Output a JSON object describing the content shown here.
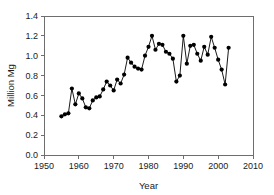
{
  "chart_data": {
    "type": "line",
    "title": "",
    "xlabel": "Year",
    "ylabel": "Million Mg",
    "xlim": [
      1950,
      2010
    ],
    "ylim": [
      0.0,
      1.4
    ],
    "xticks": [
      1950,
      1960,
      1970,
      1980,
      1990,
      2000,
      2010
    ],
    "xtick_labels": [
      "1950",
      "1960",
      "1970",
      "1980",
      "1990",
      "2000",
      "2010"
    ],
    "yticks": [
      0.0,
      0.2,
      0.4,
      0.6,
      0.8,
      1.0,
      1.2,
      1.4
    ],
    "ytick_labels": [
      "0.0",
      "0.2",
      "0.4",
      "0.6",
      "0.8",
      "1.0",
      "1.2",
      "1.4"
    ],
    "grid": false,
    "legend": false,
    "legend_position": "none",
    "marker": "filled-circle",
    "line_color": "#000000",
    "marker_color": "#000000",
    "x": [
      1955,
      1956,
      1957,
      1958,
      1959,
      1960,
      1961,
      1962,
      1963,
      1964,
      1965,
      1966,
      1967,
      1968,
      1969,
      1970,
      1971,
      1972,
      1973,
      1974,
      1975,
      1976,
      1977,
      1978,
      1979,
      1980,
      1981,
      1982,
      1983,
      1984,
      1985,
      1986,
      1987,
      1988,
      1989,
      1990,
      1991,
      1992,
      1993,
      1994,
      1995,
      1996,
      1997,
      1998,
      1999,
      2000,
      2001,
      2002,
      2003
    ],
    "values": [
      0.39,
      0.41,
      0.42,
      0.67,
      0.51,
      0.62,
      0.57,
      0.48,
      0.47,
      0.55,
      0.58,
      0.59,
      0.66,
      0.74,
      0.7,
      0.65,
      0.76,
      0.72,
      0.81,
      0.98,
      0.93,
      0.89,
      0.87,
      0.86,
      1.0,
      1.09,
      1.2,
      1.06,
      1.12,
      1.11,
      1.04,
      1.02,
      0.97,
      0.74,
      0.8,
      1.2,
      0.92,
      1.1,
      1.11,
      1.02,
      0.95,
      1.09,
      1.01,
      1.19,
      1.08,
      0.96,
      0.86,
      0.71,
      1.08
    ],
    "series": [
      {
        "name": "Million Mg",
        "values": [
          0.39,
          0.41,
          0.42,
          0.67,
          0.51,
          0.62,
          0.57,
          0.48,
          0.47,
          0.55,
          0.58,
          0.59,
          0.66,
          0.74,
          0.7,
          0.65,
          0.76,
          0.72,
          0.81,
          0.98,
          0.93,
          0.89,
          0.87,
          0.86,
          1.0,
          1.09,
          1.2,
          1.06,
          1.12,
          1.11,
          1.04,
          1.02,
          0.97,
          0.74,
          0.8,
          1.2,
          0.92,
          1.1,
          1.11,
          1.02,
          0.95,
          1.09,
          1.01,
          1.19,
          1.08,
          0.96,
          0.86,
          0.71,
          1.08
        ]
      }
    ]
  }
}
